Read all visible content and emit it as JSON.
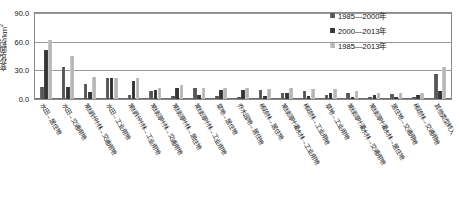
{
  "chart_data": {
    "type": "bar",
    "title": "",
    "xlabel": "",
    "ylabel": "变化面积/km2",
    "ylabel_display": "变化面积/km",
    "ylabel_sup": "2",
    "ylim": [
      0,
      90
    ],
    "yticks": [
      "0.0",
      "30.0",
      "60.0",
      "90.0"
    ],
    "ytick_values": [
      0,
      30,
      60,
      90
    ],
    "grid": true,
    "legend_position": "top-right",
    "categories": [
      "水田→居住地",
      "水田→交通用地",
      "常绿针叶林→交通用地",
      "水田→工业用地",
      "常绿针叶林→工业用地",
      "常绿阔叶林→交通用地",
      "常绿阔叶林→居住地",
      "常绿阔叶林→工业用地",
      "草地→居住地",
      "乔木园地→居住地",
      "稀疏林→居住地",
      "常绿阔叶灌木林→工业用地",
      "稀疏林→工业用地",
      "草地→工业用地",
      "常绿阔叶灌木林→交通用地",
      "常绿阔叶灌木林→居住地",
      "居住地→交通用地",
      "稀疏林→交通用地",
      "其他类型转入"
    ],
    "series": [
      {
        "name": "1985—2000年",
        "color": "#555555",
        "values": [
          13.0,
          33.0,
          15.5,
          22.0,
          4.0,
          8.5,
          3.0,
          11.5,
          3.0,
          2.5,
          9.5,
          6.0,
          8.5,
          4.5,
          6.5,
          2.0,
          5.0,
          2.0,
          26.0
        ]
      },
      {
        "name": "2000—2013年",
        "color": "#333333",
        "values": [
          51.0,
          13.0,
          7.5,
          22.0,
          19.0,
          9.5,
          11.5,
          4.0,
          9.0,
          9.5,
          3.0,
          6.0,
          3.5,
          6.5,
          2.0,
          4.5,
          2.0,
          4.5,
          8.0
        ]
      },
      {
        "name": "1985—2013年",
        "color": "#c0c0c0",
        "values": [
          62.0,
          45.0,
          23.0,
          22.0,
          22.5,
          12.0,
          14.5,
          12.0,
          12.0,
          11.5,
          11.0,
          11.5,
          11.0,
          10.5,
          8.0,
          6.0,
          6.5,
          6.5,
          33.0
        ]
      }
    ]
  },
  "legend": {
    "items": [
      {
        "label": "1985—2000年",
        "swatch": "legend-swatch-1985-2000"
      },
      {
        "label": "2000—2013年",
        "swatch": "legend-swatch-2000-2013"
      },
      {
        "label": "1985—2013年",
        "swatch": "legend-swatch-1985-2013"
      }
    ]
  }
}
